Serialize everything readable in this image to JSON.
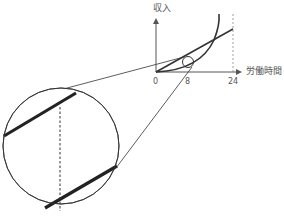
{
  "diagram": {
    "y_axis_label": "収入",
    "x_axis_label": "労働時間",
    "x_ticks": [
      "0",
      "8",
      "24"
    ],
    "colors": {
      "line": "#333333",
      "thin": "#555555",
      "dashed": "#888888"
    },
    "curves": [
      {
        "name": "straight-income-line",
        "shape": "line"
      },
      {
        "name": "convex-income-curve",
        "shape": "curve"
      }
    ],
    "magnifier": {
      "note": "enlarged view around x = 8 showing two parallel segments and a dashed vertical line"
    }
  }
}
